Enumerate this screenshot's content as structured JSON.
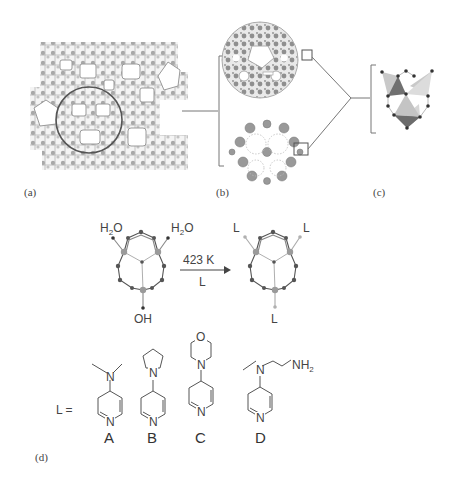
{
  "figure": {
    "panels": {
      "a": {
        "label": "(a)",
        "description": "extended framework structure with highlighted circular cage"
      },
      "b": {
        "label": "(b)",
        "description": "isolated cage, two views"
      },
      "c": {
        "label": "(c)",
        "description": "trimer building unit of three tetrahedra"
      },
      "d": {
        "label": "(d)",
        "description": "ligand exchange reaction"
      }
    },
    "reaction": {
      "left_ligands": [
        "H2O",
        "H2O",
        "OH"
      ],
      "left_labels": {
        "top_left": "H",
        "top_left_sub": "2",
        "top_left_tail": "O",
        "top_right": "H",
        "top_right_sub": "2",
        "top_right_tail": "O",
        "bottom": "OH"
      },
      "arrow_top": "423 K",
      "arrow_bottom": "L",
      "right_labels": {
        "top_left": "L",
        "top_right": "L",
        "bottom": "L"
      }
    },
    "ligands": {
      "prefix": "L =",
      "items": [
        {
          "letter": "A",
          "name": "4-(dimethylamino)pyridine",
          "atoms": [
            "N",
            "N"
          ]
        },
        {
          "letter": "B",
          "name": "4-pyrrolidinopyridine",
          "atoms": [
            "N",
            "N"
          ]
        },
        {
          "letter": "C",
          "name": "4-morpholinopyridine",
          "atoms": [
            "O",
            "N",
            "N"
          ]
        },
        {
          "letter": "D",
          "name": "N-methyl-N-(3-aminopropyl)-4-aminopyridine",
          "atoms": [
            "N",
            "N"
          ],
          "amine": "NH",
          "amine_sub": "2"
        }
      ]
    },
    "colors": {
      "ink": "#444444",
      "light_gray": "#bbbbbb",
      "mid_gray": "#888888",
      "dark_gray": "#555555"
    }
  }
}
